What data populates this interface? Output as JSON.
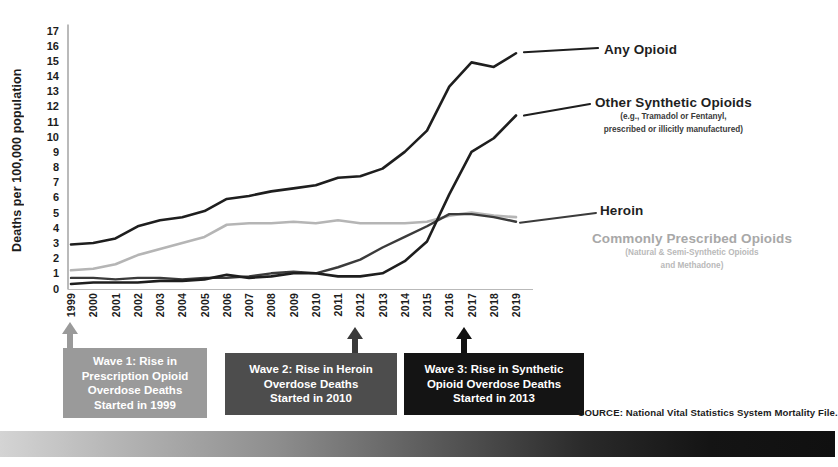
{
  "chart_data": {
    "type": "line",
    "title": "",
    "xlabel": "",
    "ylabel": "Deaths per 100,000 population",
    "ylim": [
      0,
      17
    ],
    "ytick_step": 1,
    "grid": false,
    "legend_position": "right-inline",
    "categories": [
      "1999",
      "2000",
      "2001",
      "2002",
      "2003",
      "2004",
      "2005",
      "2006",
      "2007",
      "2008",
      "2009",
      "2010",
      "2011",
      "2012",
      "2013",
      "2014",
      "2015",
      "2016",
      "2017",
      "2018",
      "2019"
    ],
    "yticks": [
      "17",
      "16",
      "15",
      "14",
      "13",
      "12",
      "11",
      "10",
      "9",
      "8",
      "7",
      "6",
      "5",
      "4",
      "3",
      "2",
      "1",
      "0"
    ],
    "series": [
      {
        "name": "Any Opioid",
        "color": "#1e1e1e",
        "width": 2.6,
        "values": [
          2.9,
          3.0,
          3.3,
          4.1,
          4.5,
          4.7,
          5.1,
          5.9,
          6.1,
          6.4,
          6.6,
          6.8,
          7.3,
          7.4,
          7.9,
          9.0,
          10.4,
          13.3,
          14.9,
          14.6,
          15.5
        ]
      },
      {
        "name": "Other Synthetic Opioids",
        "sublabel_line1": "(e.g., Tramadol or Fentanyl,",
        "sublabel_line2": "prescribed or illicitly manufactured)",
        "color": "#1e1e1e",
        "width": 2.6,
        "values": [
          0.3,
          0.4,
          0.4,
          0.4,
          0.5,
          0.5,
          0.6,
          0.9,
          0.7,
          0.8,
          1.0,
          1.0,
          0.8,
          0.8,
          1.0,
          1.8,
          3.1,
          6.2,
          9.0,
          9.9,
          11.4
        ]
      },
      {
        "name": "Heroin",
        "color": "#3b3b3b",
        "width": 2.4,
        "values": [
          0.7,
          0.7,
          0.6,
          0.7,
          0.7,
          0.6,
          0.7,
          0.7,
          0.8,
          1.0,
          1.1,
          1.0,
          1.4,
          1.9,
          2.7,
          3.4,
          4.1,
          4.9,
          4.9,
          4.7,
          4.4
        ]
      },
      {
        "name": "Commonly Prescribed Opioids",
        "sublabel_line1": "(Natural & Semi-Synthetic Opioids",
        "sublabel_line2": "and Methadone)",
        "color": "#b5b5b5",
        "width": 2.6,
        "values": [
          1.2,
          1.3,
          1.6,
          2.2,
          2.6,
          3.0,
          3.4,
          4.2,
          4.3,
          4.3,
          4.4,
          4.3,
          4.5,
          4.3,
          4.3,
          4.3,
          4.4,
          4.8,
          5.0,
          4.8,
          4.7
        ]
      }
    ],
    "annotations": [
      {
        "id": "wave-1",
        "lines": [
          "Wave 1: Rise in",
          "Prescription Opioid",
          "Overdose Deaths",
          "Started in 1999"
        ],
        "marker_year": "1999",
        "bg": "#9a9a9a",
        "arrow_color": "#9a9a9a"
      },
      {
        "id": "wave-2",
        "lines": [
          "Wave 2: Rise in Heroin",
          "Overdose Deaths",
          "Started in 2010"
        ],
        "marker_year": "2010",
        "bg": "#4d4d4d",
        "arrow_color": "#3a3a3a"
      },
      {
        "id": "wave-3",
        "lines": [
          "Wave 3: Rise in Synthetic",
          "Opioid Overdose Deaths",
          "Started in 2013"
        ],
        "marker_year": "2013",
        "bg": "#141414",
        "arrow_color": "#111111"
      }
    ],
    "source": "SOURCE: National Vital Statistics System Mortality File."
  }
}
